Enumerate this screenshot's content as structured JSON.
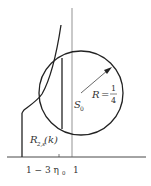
{
  "diagram": {
    "labels": {
      "radius_var": "R",
      "radius_eq": "=",
      "radius_num": "1",
      "radius_den": "4",
      "center": "S",
      "center_sub": "0",
      "region": "R",
      "region_sub": "2,s",
      "region_arg": "(k)",
      "axis_left_tick": "1 − 3 η",
      "axis_left_tick_sub": "0",
      "axis_right_tick": "1"
    },
    "colors": {
      "stroke": "#222222",
      "thin": "#555555",
      "text": "#333333"
    }
  }
}
